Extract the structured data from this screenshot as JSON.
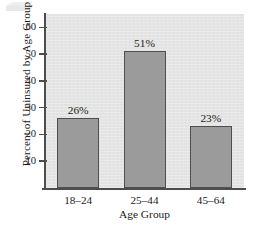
{
  "chart_data": {
    "type": "bar",
    "title": "",
    "subtitle": "",
    "xlabel": "Age Group",
    "ylabel": "Percent of Uninsured by Age Group",
    "categories": [
      "18–24",
      "25–44",
      "45–64"
    ],
    "values": [
      26,
      51,
      23
    ],
    "data_labels": [
      "26%",
      "51%",
      "23%"
    ],
    "ylim": [
      0,
      65
    ],
    "yticks": [
      10,
      20,
      30,
      40,
      50,
      60
    ],
    "ytick_labels": [
      "10",
      "20",
      "30",
      "40",
      "50",
      "60"
    ],
    "xticks": [
      "18–24",
      "25–44",
      "45–64"
    ],
    "grid": false,
    "legend": null,
    "legend_position": "none",
    "annotations": [],
    "colors": {
      "bar_fill": "#9b9b9b",
      "bar_edge": "#4f4f4f",
      "plot_background": "#e4e4e4",
      "figure_background": "#ffffff",
      "axis": "#4d4d4d",
      "text": "#1a1a1a"
    }
  }
}
